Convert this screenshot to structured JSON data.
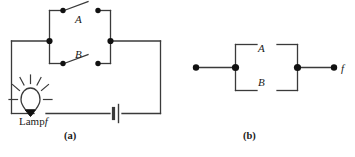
{
  "figure": {
    "background_color": "#ffffff",
    "stroke_color": "#3a3a3a",
    "node_color": "#111111",
    "panels": [
      {
        "caption": "(a)",
        "description": "series loop with battery, lamp and two parallel switches",
        "labels": {
          "switch_a": "A",
          "switch_b": "B",
          "lamp": "Lamp",
          "lamp_var": "f"
        }
      },
      {
        "caption": "(b)",
        "description": "parallel contact block with output terminal",
        "labels": {
          "contact_a": "A",
          "contact_b": "B",
          "output": "f"
        }
      }
    ]
  },
  "captions": {
    "a": "(a)",
    "b": "(b)"
  },
  "panel_a": {
    "switch_a_label": "A",
    "switch_b_label": "B",
    "lamp_text": "Lamp",
    "lamp_variable": "f"
  },
  "panel_b": {
    "contact_a_label": "A",
    "contact_b_label": "B",
    "output_label": "f"
  }
}
